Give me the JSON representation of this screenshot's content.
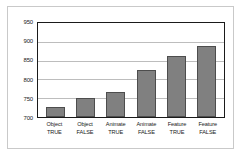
{
  "chart_data": {
    "type": "bar",
    "title": "",
    "subtitle": "",
    "xlabel": "",
    "ylabel": "",
    "categories": [
      "Object TRUE",
      "Object FALSE",
      "Animate TRUE",
      "Animate FALSE",
      "Feature TRUE",
      "Feature FALSE"
    ],
    "category_lines": [
      {
        "line1": "Object",
        "line2": "TRUE"
      },
      {
        "line1": "Object",
        "line2": "FALSE"
      },
      {
        "line1": "Animate",
        "line2": "TRUE"
      },
      {
        "line1": "Animate",
        "line2": "FALSE"
      },
      {
        "line1": "Feature",
        "line2": "TRUE"
      },
      {
        "line1": "Feature",
        "line2": "FALSE"
      }
    ],
    "values": [
      727,
      751,
      766,
      824,
      861,
      890
    ],
    "ylim": [
      700,
      950
    ],
    "yticks": [
      700,
      750,
      800,
      850,
      900,
      950
    ],
    "ytick_labels": [
      "700",
      "750",
      "800",
      "850",
      "900",
      "950"
    ],
    "grid": true,
    "grid_axis": "y",
    "legend": false,
    "legend_position": "none",
    "bar_color": "#808080",
    "bar_border_color": "#4d4d4d",
    "gridline_color": "#bdbdbd",
    "axis_color": "#1a1a1a",
    "plot_background": "#ffffff",
    "frame_color": "#c9c9c9"
  }
}
